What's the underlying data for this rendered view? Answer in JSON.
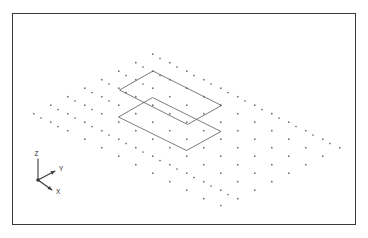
{
  "figure": {
    "title": "",
    "type": "3d-isometric-point-lattice-with-plates",
    "background_color": "#ffffff",
    "frame": {
      "name": "plot-border",
      "x": 12,
      "y": 13,
      "width": 344,
      "height": 212,
      "stroke_color": "#3a3a3a",
      "stroke_width": 1.5
    }
  },
  "axes_triad": {
    "origin": {
      "x": 38,
      "y": 180
    },
    "dot_color": "#3a3a3a",
    "line_color": "#3a3a3a",
    "axes": [
      {
        "label": "Z",
        "name": "z-axis",
        "tip": {
          "x": 38,
          "y": 159
        },
        "label_pos": {
          "x": 34.5,
          "y": 156
        },
        "arrow": false
      },
      {
        "label": "Y",
        "name": "y-axis",
        "tip": {
          "x": 55,
          "y": 171
        },
        "label_pos": {
          "x": 59,
          "y": 171
        },
        "arrow": true
      },
      {
        "label": "X",
        "name": "x-axis",
        "tip": {
          "x": 52,
          "y": 190
        },
        "label_pos": {
          "x": 56,
          "y": 194
        },
        "arrow": true
      }
    ]
  },
  "plates": [
    {
      "name": "upper-plate",
      "label": "upper parallelogram plate",
      "stroke_color": "#5a5a5a",
      "vertices": [
        {
          "x": 153.0,
          "y": 71.0
        },
        {
          "x": 221.5,
          "y": 105.5
        },
        {
          "x": 187.5,
          "y": 124.5
        },
        {
          "x": 119.5,
          "y": 90.0
        }
      ]
    },
    {
      "name": "lower-plate",
      "label": "lower parallelogram plate",
      "stroke_color": "#5a5a5a",
      "vertices": [
        {
          "x": 152.5,
          "y": 97.5
        },
        {
          "x": 221.0,
          "y": 131.5
        },
        {
          "x": 186.5,
          "y": 150.5
        },
        {
          "x": 118.5,
          "y": 117.0
        }
      ]
    }
  ],
  "chart_data": {
    "type": "scatter",
    "title": "",
    "xlabel": "X",
    "ylabel": "Y",
    "zlabel": "Z",
    "projection": "isometric",
    "grid": false,
    "legend": "none",
    "lattice": {
      "dot_color": "#6a6a6a",
      "dot_radius": 0.85,
      "projection_basis": {
        "u_step": {
          "dx": 17.0,
          "dy": 8.5
        },
        "v_step": {
          "dx": -17.0,
          "dy": 8.5
        },
        "w_step": {
          "dx": 0.0,
          "dy": -26.5
        }
      },
      "origin": {
        "x": 186.0,
        "y": 62.0
      },
      "counts": {
        "nu": 9,
        "nv": 9,
        "nw": 2
      },
      "points": [
        {
          "x": 152.8,
          "y": 54.2
        },
        {
          "x": 135.8,
          "y": 62.7
        },
        {
          "x": 169.8,
          "y": 62.7
        },
        {
          "x": 118.8,
          "y": 71.2
        },
        {
          "x": 152.8,
          "y": 71.2
        },
        {
          "x": 186.8,
          "y": 71.2
        },
        {
          "x": 101.8,
          "y": 79.7
        },
        {
          "x": 135.8,
          "y": 79.7
        },
        {
          "x": 169.8,
          "y": 79.7
        },
        {
          "x": 203.8,
          "y": 79.7
        },
        {
          "x": 84.8,
          "y": 88.2
        },
        {
          "x": 118.8,
          "y": 88.2
        },
        {
          "x": 152.8,
          "y": 88.2
        },
        {
          "x": 186.8,
          "y": 88.2
        },
        {
          "x": 220.8,
          "y": 88.2
        },
        {
          "x": 67.8,
          "y": 96.7
        },
        {
          "x": 101.8,
          "y": 96.7
        },
        {
          "x": 135.8,
          "y": 96.7
        },
        {
          "x": 169.8,
          "y": 96.7
        },
        {
          "x": 203.8,
          "y": 96.7
        },
        {
          "x": 237.8,
          "y": 96.7
        },
        {
          "x": 50.8,
          "y": 105.2
        },
        {
          "x": 84.8,
          "y": 105.2
        },
        {
          "x": 118.8,
          "y": 105.2
        },
        {
          "x": 152.8,
          "y": 105.2
        },
        {
          "x": 186.8,
          "y": 105.2
        },
        {
          "x": 220.8,
          "y": 105.2
        },
        {
          "x": 254.8,
          "y": 105.2
        },
        {
          "x": 33.8,
          "y": 113.7
        },
        {
          "x": 67.8,
          "y": 113.7
        },
        {
          "x": 101.8,
          "y": 113.7
        },
        {
          "x": 135.8,
          "y": 113.7
        },
        {
          "x": 169.8,
          "y": 113.7
        },
        {
          "x": 203.8,
          "y": 113.7
        },
        {
          "x": 237.8,
          "y": 113.7
        },
        {
          "x": 271.8,
          "y": 113.7
        },
        {
          "x": 50.8,
          "y": 122.2
        },
        {
          "x": 84.8,
          "y": 122.2
        },
        {
          "x": 118.8,
          "y": 122.2
        },
        {
          "x": 152.8,
          "y": 122.2
        },
        {
          "x": 186.8,
          "y": 122.2
        },
        {
          "x": 220.8,
          "y": 122.2
        },
        {
          "x": 254.8,
          "y": 122.2
        },
        {
          "x": 288.8,
          "y": 122.2
        },
        {
          "x": 67.8,
          "y": 130.7
        },
        {
          "x": 101.8,
          "y": 130.7
        },
        {
          "x": 135.8,
          "y": 130.7
        },
        {
          "x": 169.8,
          "y": 130.7
        },
        {
          "x": 203.8,
          "y": 130.7
        },
        {
          "x": 237.8,
          "y": 130.7
        },
        {
          "x": 271.8,
          "y": 130.7
        },
        {
          "x": 305.8,
          "y": 130.7
        },
        {
          "x": 84.8,
          "y": 139.2
        },
        {
          "x": 118.8,
          "y": 139.2
        },
        {
          "x": 152.8,
          "y": 139.2
        },
        {
          "x": 186.8,
          "y": 139.2
        },
        {
          "x": 220.8,
          "y": 139.2
        },
        {
          "x": 254.8,
          "y": 139.2
        },
        {
          "x": 288.8,
          "y": 139.2
        },
        {
          "x": 322.8,
          "y": 139.2
        },
        {
          "x": 101.8,
          "y": 147.7
        },
        {
          "x": 135.8,
          "y": 147.7
        },
        {
          "x": 169.8,
          "y": 147.7
        },
        {
          "x": 203.8,
          "y": 147.7
        },
        {
          "x": 237.8,
          "y": 147.7
        },
        {
          "x": 271.8,
          "y": 147.7
        },
        {
          "x": 305.8,
          "y": 147.7
        },
        {
          "x": 339.8,
          "y": 147.7
        },
        {
          "x": 118.8,
          "y": 156.2
        },
        {
          "x": 152.8,
          "y": 156.2
        },
        {
          "x": 186.8,
          "y": 156.2
        },
        {
          "x": 220.8,
          "y": 156.2
        },
        {
          "x": 254.8,
          "y": 156.2
        },
        {
          "x": 288.8,
          "y": 156.2
        },
        {
          "x": 322.8,
          "y": 156.2
        },
        {
          "x": 135.8,
          "y": 164.7
        },
        {
          "x": 169.8,
          "y": 164.7
        },
        {
          "x": 203.8,
          "y": 164.7
        },
        {
          "x": 237.8,
          "y": 164.7
        },
        {
          "x": 271.8,
          "y": 164.7
        },
        {
          "x": 305.8,
          "y": 164.7
        },
        {
          "x": 152.8,
          "y": 173.2
        },
        {
          "x": 186.8,
          "y": 173.2
        },
        {
          "x": 220.8,
          "y": 173.2
        },
        {
          "x": 254.8,
          "y": 173.2
        },
        {
          "x": 288.8,
          "y": 173.2
        },
        {
          "x": 169.8,
          "y": 181.7
        },
        {
          "x": 203.8,
          "y": 181.7
        },
        {
          "x": 237.8,
          "y": 181.7
        },
        {
          "x": 271.8,
          "y": 181.7
        },
        {
          "x": 186.8,
          "y": 190.2
        },
        {
          "x": 220.8,
          "y": 190.2
        },
        {
          "x": 254.8,
          "y": 190.2
        },
        {
          "x": 203.8,
          "y": 198.7
        },
        {
          "x": 237.8,
          "y": 198.7
        },
        {
          "x": 220.8,
          "y": 205.5
        },
        {
          "x": 160.0,
          "y": 58.5
        },
        {
          "x": 143.0,
          "y": 67.0
        },
        {
          "x": 177.0,
          "y": 67.0
        },
        {
          "x": 126.0,
          "y": 75.5
        },
        {
          "x": 160.0,
          "y": 75.5
        },
        {
          "x": 194.0,
          "y": 75.5
        },
        {
          "x": 109.0,
          "y": 84.0
        },
        {
          "x": 143.0,
          "y": 84.0
        },
        {
          "x": 211.0,
          "y": 84.0
        },
        {
          "x": 92.0,
          "y": 92.5
        },
        {
          "x": 126.0,
          "y": 92.5
        },
        {
          "x": 228.0,
          "y": 92.5
        },
        {
          "x": 75.0,
          "y": 101.0
        },
        {
          "x": 109.0,
          "y": 101.0
        },
        {
          "x": 245.0,
          "y": 101.0
        },
        {
          "x": 58.0,
          "y": 109.5
        },
        {
          "x": 92.0,
          "y": 109.5
        },
        {
          "x": 262.0,
          "y": 109.5
        },
        {
          "x": 41.0,
          "y": 118.0
        },
        {
          "x": 75.0,
          "y": 118.0
        },
        {
          "x": 279.0,
          "y": 118.0
        },
        {
          "x": 58.0,
          "y": 126.5
        },
        {
          "x": 92.0,
          "y": 126.5
        },
        {
          "x": 296.0,
          "y": 126.5
        },
        {
          "x": 109.0,
          "y": 135.0
        },
        {
          "x": 313.0,
          "y": 135.0
        },
        {
          "x": 126.0,
          "y": 143.5
        },
        {
          "x": 330.0,
          "y": 143.5
        },
        {
          "x": 143.0,
          "y": 152.0
        },
        {
          "x": 160.0,
          "y": 160.5
        },
        {
          "x": 177.0,
          "y": 169.0
        },
        {
          "x": 194.0,
          "y": 177.5
        },
        {
          "x": 211.0,
          "y": 186.0
        },
        {
          "x": 228.0,
          "y": 194.5
        }
      ]
    }
  }
}
